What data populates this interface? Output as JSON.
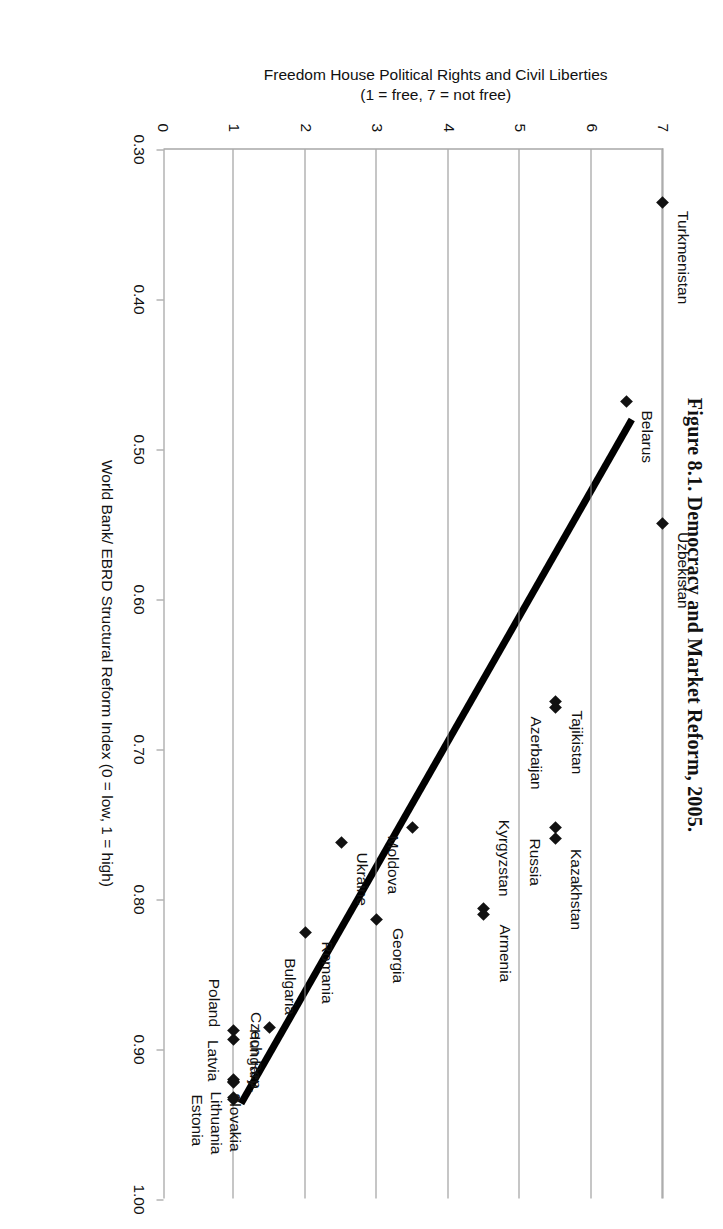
{
  "figure": {
    "title": "Figure 8.1. Democracy and Market Reform, 2005."
  },
  "axes": {
    "x": {
      "caption": "World Bank/ EBRD Structural Reform Index (0 = low, 1 = high)",
      "ticks": [
        "0.30",
        "0.40",
        "0.50",
        "0.60",
        "0.70",
        "0.80",
        "0.90",
        "1.00"
      ],
      "min": 0.3,
      "max": 1.0
    },
    "y": {
      "caption_line1": "Freedom House Political Rights and Civil Liberties",
      "caption_line2": "(1 = free, 7 = not free)",
      "ticks": [
        "0",
        "1",
        "2",
        "3",
        "4",
        "5",
        "6",
        "7"
      ],
      "min": 0,
      "max": 7
    }
  },
  "chart_data": {
    "type": "scatter",
    "title": "Figure 8.1. Democracy and Market Reform, 2005.",
    "xlabel": "World Bank/ EBRD Structural Reform Index (0 = low, 1 = high)",
    "ylabel": "Freedom House Political Rights and Civil Liberties (1 = free, 7 = not free)",
    "xlim": [
      0.3,
      1.0
    ],
    "ylim": [
      0,
      7
    ],
    "grid": "horizontal-at-integer-y",
    "legend": "none",
    "marker": "diamond",
    "points": [
      {
        "label": "Turkmenistan",
        "x": 0.335,
        "y": 7.0,
        "label_pos": "right"
      },
      {
        "label": "Belarus",
        "x": 0.468,
        "y": 6.5,
        "label_pos": "right"
      },
      {
        "label": "Uzbekistan",
        "x": 0.549,
        "y": 7.0,
        "label_pos": "right"
      },
      {
        "label": "Tajikistan",
        "x": 0.668,
        "y": 5.5,
        "label_pos": "right"
      },
      {
        "label": "Azerbaijan",
        "x": 0.672,
        "y": 5.5,
        "label_pos": "right"
      },
      {
        "label": "Russia",
        "x": 0.752,
        "y": 5.5,
        "label_pos": "right"
      },
      {
        "label": "Kazakhstan",
        "x": 0.759,
        "y": 5.5,
        "label_pos": "right"
      },
      {
        "label": "Moldova",
        "x": 0.752,
        "y": 3.5,
        "label_pos": "right"
      },
      {
        "label": "Kyrgyzstan",
        "x": 0.806,
        "y": 4.5,
        "label_pos": "right"
      },
      {
        "label": "Armenia",
        "x": 0.81,
        "y": 4.5,
        "label_pos": "right"
      },
      {
        "label": "Ukraine",
        "x": 0.762,
        "y": 2.5,
        "label_pos": "right"
      },
      {
        "label": "Georgia",
        "x": 0.813,
        "y": 3.0,
        "label_pos": "right"
      },
      {
        "label": "Romania",
        "x": 0.822,
        "y": 2.0,
        "label_pos": "right"
      },
      {
        "label": "Bulgaria",
        "x": 0.885,
        "y": 1.5,
        "label_pos": "right"
      },
      {
        "label": "Czech Rep.",
        "x": 0.933,
        "y": 1.0,
        "label_pos": "right"
      },
      {
        "label": "Hungary",
        "x": 0.932,
        "y": 1.0,
        "label_pos": "right"
      },
      {
        "label": "Poland",
        "x": 0.893,
        "y": 1.0,
        "label_pos": "right"
      },
      {
        "label": "Latvia",
        "x": 0.887,
        "y": 1.0,
        "label_pos": "right"
      },
      {
        "label": "Slovakia",
        "x": 0.921,
        "y": 1.0,
        "label_pos": "right"
      },
      {
        "label": "Lithuania",
        "x": 0.92,
        "y": 1.0,
        "label_pos": "right"
      },
      {
        "label": "Estonia",
        "x": 0.922,
        "y": 1.0,
        "label_pos": "right"
      }
    ],
    "trendline": {
      "x_start": 0.48,
      "y_start": 6.57,
      "x_end": 0.936,
      "y_end": 1.1,
      "style": "solid-thick-black"
    }
  },
  "colors": {
    "marker": "#111111",
    "trendline": "#000000",
    "grid": "#8e8e8e",
    "text": "#111111"
  }
}
